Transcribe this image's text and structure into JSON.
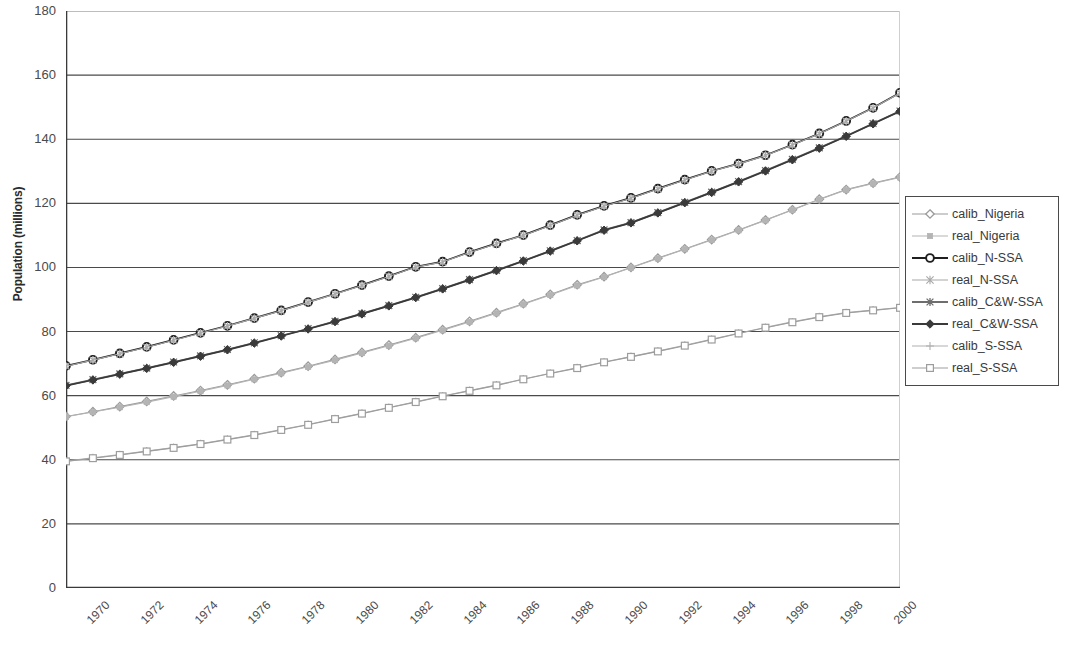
{
  "chart_data": {
    "type": "line",
    "title": "",
    "xlabel": "",
    "ylabel": "Population (millions)",
    "xlim": [
      1970,
      2001
    ],
    "ylim": [
      0,
      180
    ],
    "ytick_step": 20,
    "ytick_labels": [
      "0",
      "20",
      "40",
      "60",
      "80",
      "100",
      "120",
      "140",
      "160",
      "180"
    ],
    "xtick_labels": [
      "1970",
      "1972",
      "1974",
      "1976",
      "1978",
      "1980",
      "1982",
      "1984",
      "1986",
      "1988",
      "1990",
      "1992",
      "1994",
      "1996",
      "1998",
      "2000"
    ],
    "xtick_values": [
      1970,
      1972,
      1974,
      1976,
      1978,
      1980,
      1982,
      1984,
      1986,
      1988,
      1990,
      1992,
      1994,
      1996,
      1998,
      2000
    ],
    "x": [
      1970,
      1971,
      1972,
      1973,
      1974,
      1975,
      1976,
      1977,
      1978,
      1979,
      1980,
      1981,
      1982,
      1983,
      1984,
      1985,
      1986,
      1987,
      1988,
      1989,
      1990,
      1991,
      1992,
      1993,
      1994,
      1995,
      1996,
      1997,
      1998,
      1999,
      2000,
      2001
    ],
    "grid": "horizontal",
    "legend_position": "right",
    "series": [
      {
        "name": "calib_Nigeria",
        "color": "#9a9a9a",
        "marker": "diamond-open",
        "values": [
          53.5,
          55.0,
          56.6,
          58.2,
          59.9,
          61.6,
          63.4,
          65.3,
          67.2,
          69.2,
          71.3,
          73.5,
          75.8,
          78.1,
          80.6,
          83.2,
          85.9,
          88.7,
          91.6,
          94.6,
          97.1,
          100.0,
          102.9,
          105.8,
          108.7,
          111.7,
          114.8,
          118.0,
          121.3,
          124.3,
          126.3,
          128.2
        ]
      },
      {
        "name": "real_Nigeria",
        "color": "#b4b4b4",
        "marker": "square-small",
        "values": [
          53.4,
          54.9,
          56.4,
          58.0,
          59.7,
          61.4,
          63.2,
          65.1,
          67.0,
          69.0,
          71.1,
          73.3,
          75.6,
          77.9,
          80.4,
          83.0,
          85.7,
          88.5,
          91.4,
          94.4,
          97.0,
          99.9,
          102.8,
          105.7,
          108.6,
          111.6,
          114.7,
          117.9,
          121.2,
          124.2,
          126.2,
          128.1
        ]
      },
      {
        "name": "calib_N-SSA",
        "color": "#1f1f1f",
        "marker": "circle-bold",
        "values": [
          69.3,
          71.2,
          73.2,
          75.2,
          77.4,
          79.6,
          81.8,
          84.2,
          86.6,
          89.2,
          91.8,
          94.5,
          97.3,
          100.2,
          101.8,
          104.8,
          107.5,
          110.1,
          113.2,
          116.4,
          119.2,
          121.7,
          124.6,
          127.4,
          130.1,
          132.4,
          135.0,
          138.3,
          141.8,
          145.7,
          149.8,
          154.5
        ]
      },
      {
        "name": "real_N-SSA",
        "color": "#a8a8a8",
        "marker": "star",
        "values": [
          69.2,
          71.1,
          73.1,
          75.1,
          77.3,
          79.5,
          81.7,
          84.1,
          86.5,
          89.1,
          91.7,
          94.4,
          97.2,
          100.1,
          101.7,
          104.7,
          107.4,
          110.0,
          113.1,
          116.3,
          119.1,
          121.6,
          124.5,
          127.3,
          130.0,
          132.3,
          134.9,
          138.2,
          141.7,
          145.6,
          149.7,
          154.4
        ]
      },
      {
        "name": "calib_C&W-SSA",
        "color": "#6e6e6e",
        "marker": "asterisk",
        "values": [
          63.2,
          65.0,
          66.8,
          68.6,
          70.5,
          72.4,
          74.4,
          76.5,
          78.7,
          80.9,
          83.2,
          85.6,
          88.1,
          90.7,
          93.4,
          96.2,
          99.1,
          102.1,
          105.2,
          108.4,
          111.7,
          114.0,
          117.1,
          120.3,
          123.5,
          126.8,
          130.2,
          133.7,
          137.3,
          141.0,
          144.9,
          148.8
        ]
      },
      {
        "name": "real_C&W-SSA",
        "color": "#3a3a3a",
        "marker": "diamond-filled",
        "values": [
          63.1,
          64.9,
          66.7,
          68.5,
          70.4,
          72.3,
          74.3,
          76.4,
          78.6,
          80.8,
          83.1,
          85.5,
          88.0,
          90.6,
          93.3,
          96.1,
          99.0,
          102.0,
          105.1,
          108.3,
          111.6,
          113.9,
          117.0,
          120.2,
          123.4,
          126.7,
          130.1,
          133.6,
          137.2,
          140.9,
          144.8,
          148.7
        ]
      },
      {
        "name": "calib_S-SSA",
        "color": "#b0b0b0",
        "marker": "plus",
        "values": [
          39.6,
          40.6,
          41.6,
          42.7,
          43.8,
          45.0,
          46.4,
          47.8,
          49.4,
          51.0,
          52.8,
          54.5,
          56.3,
          58.1,
          59.9,
          61.6,
          63.3,
          65.2,
          67.0,
          68.7,
          70.5,
          72.2,
          73.9,
          75.7,
          77.6,
          79.5,
          81.3,
          83.0,
          84.6,
          85.9,
          86.7,
          87.5
        ]
      },
      {
        "name": "real_S-SSA",
        "color": "#9d9d9d",
        "marker": "square-open",
        "values": [
          39.5,
          40.5,
          41.5,
          42.6,
          43.7,
          44.9,
          46.3,
          47.7,
          49.3,
          50.9,
          52.7,
          54.4,
          56.2,
          58.0,
          59.8,
          61.5,
          63.2,
          65.1,
          66.9,
          68.6,
          70.4,
          72.1,
          73.8,
          75.6,
          77.5,
          79.4,
          81.2,
          82.9,
          84.5,
          85.8,
          86.6,
          87.4
        ]
      }
    ]
  },
  "legend": {
    "items": [
      {
        "label": "calib_Nigeria"
      },
      {
        "label": "real_Nigeria"
      },
      {
        "label": "calib_N-SSA"
      },
      {
        "label": "real_N-SSA"
      },
      {
        "label": "calib_C&W-SSA"
      },
      {
        "label": "real_C&W-SSA"
      },
      {
        "label": "calib_S-SSA"
      },
      {
        "label": "real_S-SSA"
      }
    ]
  },
  "axes": {
    "y_title": "Population (millions)"
  }
}
